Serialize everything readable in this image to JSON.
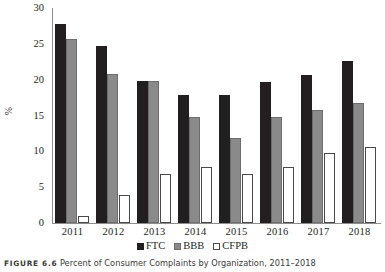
{
  "chart_data": {
    "type": "bar",
    "title": "",
    "xlabel": "",
    "ylabel": "%",
    "ylim": [
      0,
      30
    ],
    "yticks": [
      0,
      5,
      10,
      15,
      20,
      25,
      30
    ],
    "grid": false,
    "legend_position": "bottom",
    "categories": [
      "2011",
      "2012",
      "2013",
      "2014",
      "2015",
      "2016",
      "2017",
      "2018"
    ],
    "series": [
      {
        "name": "FTC",
        "color": "#231f20",
        "values": [
          27.7,
          24.7,
          19.8,
          17.8,
          17.8,
          19.7,
          20.7,
          22.6
        ]
      },
      {
        "name": "BBB",
        "color": "#8a8a8a",
        "values": [
          25.7,
          20.8,
          19.8,
          14.8,
          11.8,
          14.8,
          15.7,
          16.7
        ]
      },
      {
        "name": "CFPB",
        "color": "#ffffff",
        "values": [
          1.0,
          3.9,
          6.9,
          7.8,
          6.9,
          7.8,
          9.8,
          10.6
        ]
      }
    ]
  },
  "caption": {
    "figure_number": "FIGURE 6.6",
    "text": "Percent of Consumer Complaints by Organization, 2011–2018"
  }
}
